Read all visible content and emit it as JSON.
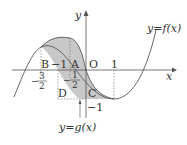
{
  "axes": {
    "x_label": "x",
    "y_label": "y",
    "origin_label": "O"
  },
  "curves": [
    {
      "name": "f",
      "label": "y=f(x)"
    },
    {
      "name": "g",
      "label": "y=g(x)"
    }
  ],
  "points": {
    "A": "A",
    "B": "B",
    "C": "C",
    "D": "D"
  },
  "ticks": {
    "x_one": "1",
    "x_neg_one": "−1",
    "x_neg_three_halves_num": "3",
    "x_neg_three_halves_den": "2",
    "x_neg_three_halves_sign": "−",
    "x_neg_half_num": "1",
    "x_neg_half_den": "2",
    "x_neg_half_sign": "−",
    "y_neg_one": "−1"
  },
  "colors": {
    "shade": "#c8c8c8",
    "line": "#555555"
  }
}
